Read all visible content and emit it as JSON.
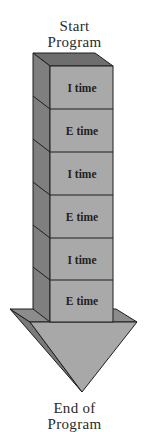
{
  "diagram": {
    "start_label_line1": "Start",
    "start_label_line2": "Program",
    "end_label_line1": "End of",
    "end_label_line2": "Program",
    "blocks": [
      {
        "label": "I time"
      },
      {
        "label": "E time"
      },
      {
        "label": "I time"
      },
      {
        "label": "E time"
      },
      {
        "label": "I time"
      },
      {
        "label": "E time"
      }
    ],
    "colors": {
      "front_face": "#a9a9a9",
      "side_face": "#7f7f7f",
      "top_face": "#6e6e6e",
      "outline": "#1e1e1e",
      "arrow_front": "#a8a8a8",
      "arrow_side": "#7a7a7a"
    }
  }
}
